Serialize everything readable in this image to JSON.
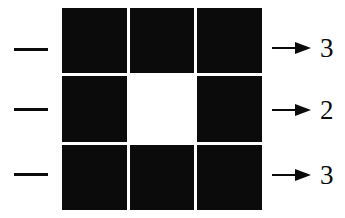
{
  "figure": {
    "type": "grid-row-count-diagram",
    "background_color": "#ffffff",
    "ink_color": "#0b0b0b"
  },
  "grid": {
    "rows": 3,
    "columns": 3,
    "filled_color": "#0b0b0b",
    "empty_color": "#ffffff",
    "cells": [
      [
        "filled",
        "filled",
        "filled"
      ],
      [
        "filled",
        "empty",
        "filled"
      ],
      [
        "filled",
        "filled",
        "filled"
      ]
    ]
  },
  "rows": [
    {
      "dash": "—",
      "arrow": "→",
      "count": "3"
    },
    {
      "dash": "—",
      "arrow": "→",
      "count": "2"
    },
    {
      "dash": "—",
      "arrow": "→",
      "count": "3"
    }
  ]
}
